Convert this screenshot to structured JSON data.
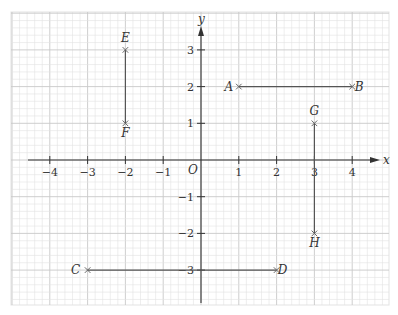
{
  "chart_data": {
    "type": "scatter",
    "title": "",
    "xlabel": "x",
    "ylabel": "y",
    "origin_label": "O",
    "xlim": [
      -4.6,
      4.7
    ],
    "ylim": [
      -3.9,
      3.6
    ],
    "x_ticks": [
      -4,
      -3,
      -2,
      -1,
      1,
      2,
      3,
      4
    ],
    "y_ticks": [
      3,
      2,
      1,
      -1,
      -2,
      -3
    ],
    "grid": true,
    "minor_grid_per_unit": 5,
    "points": [
      {
        "label": "A",
        "x": 1,
        "y": 2
      },
      {
        "label": "B",
        "x": 4,
        "y": 2
      },
      {
        "label": "C",
        "x": -3,
        "y": -3
      },
      {
        "label": "D",
        "x": 2,
        "y": -3
      },
      {
        "label": "E",
        "x": -2,
        "y": 3
      },
      {
        "label": "F",
        "x": -2,
        "y": 1
      },
      {
        "label": "G",
        "x": 3,
        "y": 1
      },
      {
        "label": "H",
        "x": 3,
        "y": -2
      }
    ],
    "segments": [
      {
        "from": "A",
        "to": "B"
      },
      {
        "from": "C",
        "to": "D"
      },
      {
        "from": "E",
        "to": "F"
      },
      {
        "from": "G",
        "to": "H"
      }
    ]
  },
  "colors": {
    "minor_grid": "#e3e3e3",
    "major_grid": "#c8c8c8",
    "axis": "#333333",
    "segment": "#555555",
    "marker": "#666666"
  }
}
